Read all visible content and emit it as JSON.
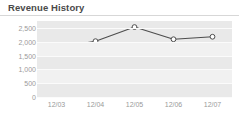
{
  "widget": {
    "title": "Revenue History"
  },
  "chart_data": {
    "type": "line",
    "title": "Revenue History",
    "xlabel": "",
    "ylabel": "",
    "categories": [
      "12/03",
      "12/04",
      "12/05",
      "12/06",
      "12/07"
    ],
    "values": [
      1790,
      2020,
      2530,
      2090,
      2180
    ],
    "series": [
      {
        "name": "Revenue",
        "values": [
          1790,
          2020,
          2530,
          2090,
          2180
        ]
      }
    ],
    "ylim": [
      0,
      2750
    ],
    "yticks": [
      0,
      500,
      1000,
      1500,
      2000,
      2500
    ],
    "ytick_labels": [
      "0",
      "500",
      "1,000",
      "1,500",
      "2,000",
      "2,500"
    ],
    "xtick_labels": [
      "12/03",
      "12/04",
      "12/05",
      "12/06",
      "12/07"
    ],
    "grid": true,
    "legend": "none",
    "colors": {
      "line": "#4d4d4d",
      "marker_fill": "#ffffff",
      "marker_stroke": "#4d4d4d",
      "plot_background": "#e9e9e9",
      "gridline": "#fbfbfb",
      "band": "#f1f1f1",
      "tick_label": "#9a9a9a",
      "title": "#4a4a4a",
      "header_rule": "#d7d7d7"
    }
  }
}
